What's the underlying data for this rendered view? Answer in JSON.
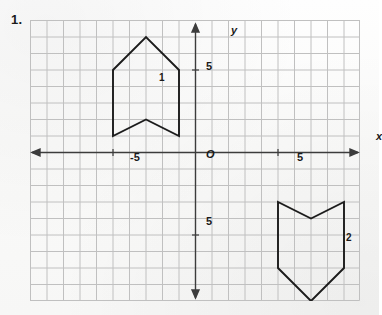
{
  "problem": {
    "number": "1."
  },
  "grid": {
    "cell_size_px": 16.5,
    "cols": 20,
    "rows": 17,
    "grid_color": "#bdbdbd",
    "axis_color": "#3a3a3a",
    "shape_color": "#1c1c1c",
    "background": "#fbfbfb"
  },
  "axes": {
    "x_label": "x",
    "y_label": "y",
    "origin_label": "O",
    "x_ticks": [
      {
        "label": "-5",
        "value": -5
      },
      {
        "label": "5",
        "value": 5
      }
    ],
    "y_ticks": [
      {
        "label": "5",
        "value": 5
      },
      {
        "label": "5",
        "value": -5
      }
    ]
  },
  "shapes": [
    {
      "label": "1",
      "name": "arrow-shape-1",
      "orientation": "up",
      "vertices": [
        [
          -5,
          1
        ],
        [
          -5,
          5
        ],
        [
          -3,
          7
        ],
        [
          -1,
          5
        ],
        [
          -1,
          1
        ],
        [
          -3,
          2
        ]
      ]
    },
    {
      "label": "2",
      "name": "arrow-shape-2",
      "orientation": "down",
      "vertices": [
        [
          5,
          -3
        ],
        [
          5,
          -7
        ],
        [
          7,
          -9
        ],
        [
          9,
          -7
        ],
        [
          9,
          -3
        ],
        [
          7,
          -4
        ]
      ]
    }
  ]
}
